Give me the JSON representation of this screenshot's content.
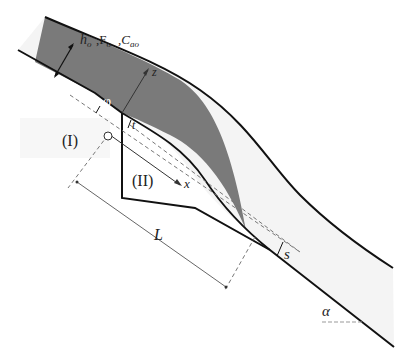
{
  "diagram": {
    "type": "hydraulic spillway / ski-jump cross-section",
    "colors": {
      "jet_fill": "#7a7a7a",
      "flow_fill": "#f4f4f4",
      "region_fill": "#f7f7f7",
      "line": "#111111",
      "dashed": "#777777"
    },
    "labels": {
      "inflow_params": "hₒ, Fₒ, Cₐₒ",
      "inflow_h": "h",
      "inflow_h_sub": "o",
      "inflow_F": "F",
      "inflow_F_sub": "o",
      "inflow_C": "C",
      "inflow_C_sub": "ao",
      "angle_phi": "φ",
      "axis_z": "z",
      "axis_x": "x",
      "offset_t": "t",
      "region_one": "(I)",
      "region_two": "(II)",
      "length_L": "L",
      "offset_s": "s",
      "angle_alpha": "α"
    }
  }
}
